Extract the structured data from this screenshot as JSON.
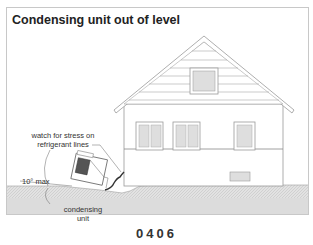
{
  "title": "Condensing unit out of level",
  "annotations": {
    "stress_note_line1": "watch for stress on",
    "stress_note_line2": "refrigerant lines",
    "angle_label": "10° max",
    "unit_label_line1": "condensing",
    "unit_label_line2": "unit"
  },
  "figure_code": "0406",
  "colors": {
    "ground": "#dcdcdc",
    "outline": "#9a9a9a",
    "window_fill": "#dedede"
  }
}
